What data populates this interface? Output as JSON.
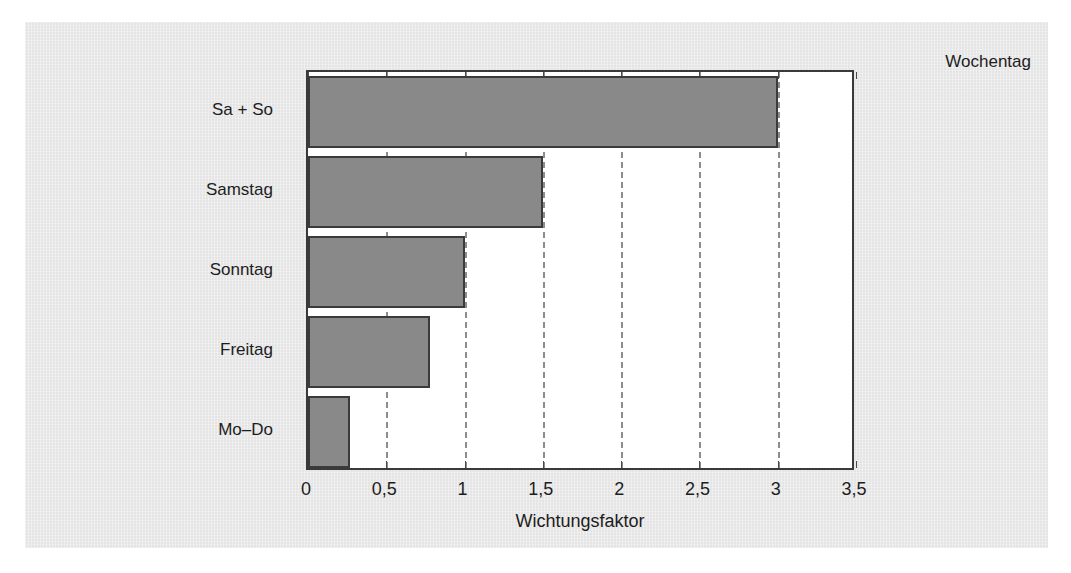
{
  "figure": {
    "background_color": "#e9e9e9",
    "plot_background_color": "#ffffff",
    "bar_fill_color": "#898989",
    "bar_edge_color": "#3b3b3b",
    "gridline_color": "#8d8d8d",
    "axis_color": "#3a3a3a"
  },
  "chart_data": {
    "type": "bar",
    "orientation": "horizontal",
    "title": "",
    "subtitle": "",
    "xlabel": "Wichtungsfaktor",
    "ylabel": "Wochentag",
    "categories": [
      "Mo–Do",
      "Freitag",
      "Sonntag",
      "Samstag",
      "Sa + So"
    ],
    "values": [
      0.27,
      0.78,
      1.0,
      1.5,
      3.0
    ],
    "series": [
      {
        "name": "Wichtungsfaktor",
        "values": [
          0.27,
          0.78,
          1.0,
          1.5,
          3.0
        ]
      }
    ],
    "xlim": [
      0,
      3.5
    ],
    "xticks": [
      0,
      0.5,
      1,
      1.5,
      2,
      2.5,
      3,
      3.5
    ],
    "xtick_labels": [
      "0",
      "0,5",
      "1",
      "1,5",
      "2",
      "2,5",
      "3",
      "3,5"
    ],
    "grid": "vertical-dashed",
    "legend": "none",
    "annotations": []
  }
}
